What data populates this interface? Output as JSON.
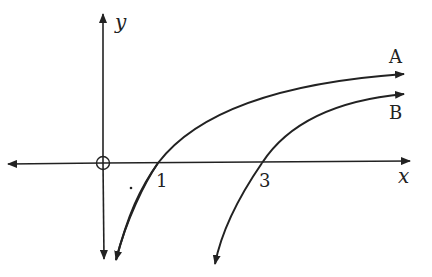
{
  "diagram": {
    "type": "graph-sketch",
    "axes": {
      "x_label": "x",
      "y_label": "y",
      "origin_marker": "circle"
    },
    "curves": [
      {
        "name": "A",
        "label": "A",
        "x_intercept": "1"
      },
      {
        "name": "B",
        "label": "B",
        "x_intercept": "3"
      }
    ],
    "tick_labels": [
      "1",
      "3"
    ],
    "colors": {
      "stroke": "#222222",
      "background": "#ffffff"
    }
  }
}
